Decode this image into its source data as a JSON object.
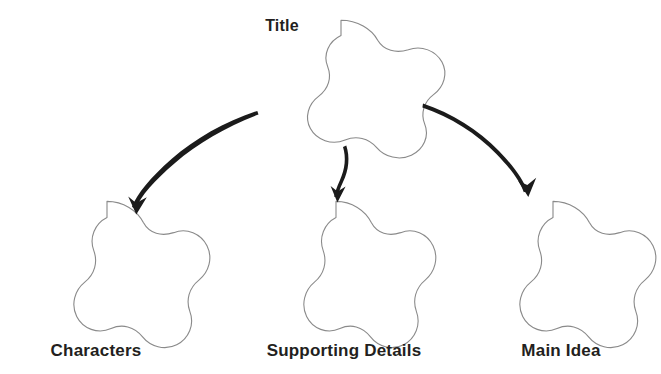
{
  "document": {
    "type": "graphic-organizer",
    "background_color": "#ffffff",
    "outline_color": "#8a8a8a",
    "text_color": "#231f20",
    "arrow_color": "#1b1b1b"
  },
  "title_node": {
    "label": "Title",
    "shape": "five-petal-flower",
    "label_position": "top-left-outside",
    "center": {
      "x": 341,
      "y": 83
    }
  },
  "child_nodes": [
    {
      "label": "Characters",
      "shape": "five-petal-flower",
      "label_position": "below",
      "center": {
        "x": 107,
        "y": 268
      }
    },
    {
      "label": "Supporting Details",
      "shape": "five-petal-flower",
      "label_position": "below",
      "center": {
        "x": 337,
        "y": 268
      }
    },
    {
      "label": "Main Idea",
      "shape": "five-petal-flower",
      "label_position": "below",
      "center": {
        "x": 553,
        "y": 268
      }
    }
  ],
  "connectors": [
    {
      "name": "arrow-title-to-characters",
      "from": "Title",
      "to": "Characters",
      "style": "hand-drawn-curved-arrow",
      "direction": "down-left"
    },
    {
      "name": "arrow-title-to-supporting-details",
      "from": "Title",
      "to": "Supporting Details",
      "style": "hand-drawn-curved-arrow",
      "direction": "down"
    },
    {
      "name": "arrow-title-to-main-idea",
      "from": "Title",
      "to": "Main Idea",
      "style": "hand-drawn-curved-arrow",
      "direction": "down-right"
    }
  ]
}
